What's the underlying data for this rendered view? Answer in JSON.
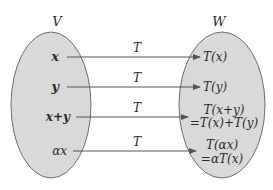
{
  "diagram": {
    "type": "linear-transformation-mapping",
    "colors": {
      "background": "#ffffff",
      "set_fill": "#d9d9d9",
      "set_stroke": "#6e6e6e",
      "arrow": "#555555",
      "text": "#2a2a2a"
    },
    "domain_set": {
      "label": "V"
    },
    "codomain_set": {
      "label": "W"
    },
    "arrow_label": "T",
    "mappings": [
      {
        "source": "x",
        "target_line1": "T(x)",
        "target_line2": ""
      },
      {
        "source": "y",
        "target_line1": "T(y)",
        "target_line2": ""
      },
      {
        "source": "x+y",
        "target_line1": "T(x+y)",
        "target_line2": "=T(x)+T(y)"
      },
      {
        "source": "αx",
        "target_line1": "T(αx)",
        "target_line2": "=αT(x)"
      }
    ]
  }
}
